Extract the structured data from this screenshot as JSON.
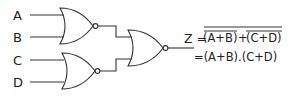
{
  "diagram": {
    "title": "",
    "inputs": [
      {
        "id": "A",
        "label": "A"
      },
      {
        "id": "B",
        "label": "B"
      },
      {
        "id": "C",
        "label": "C"
      },
      {
        "id": "D",
        "label": "D"
      }
    ],
    "gates": [
      {
        "id": "g1",
        "type": "NOR",
        "inputs": [
          "A",
          "B"
        ]
      },
      {
        "id": "g2",
        "type": "NOR",
        "inputs": [
          "C",
          "D"
        ]
      },
      {
        "id": "g3",
        "type": "NOR",
        "inputs": [
          "g1",
          "g2"
        ],
        "output": "Z"
      }
    ],
    "output_label": "Z",
    "equation": {
      "lhs": "Z =",
      "line1_term1": "(A+B)",
      "line1_plus": "+",
      "line1_term2": "(C+D)",
      "line2": "=(A+B).(C+D)"
    }
  }
}
